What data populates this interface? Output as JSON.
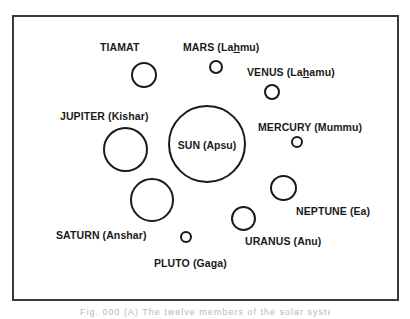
{
  "figure": {
    "stroke_color": "#1a1a1a",
    "frame_color": "#3a3a3a",
    "background": "#ffffff",
    "caption": "Fig. 000 (A) The twelve members of the solar system"
  },
  "bodies": [
    {
      "id": "sun",
      "label_main": "SUN",
      "label_alt": "(Apsu)",
      "cx": 207,
      "cy": 144,
      "r": 39,
      "label_x": 207,
      "label_y": 144,
      "label_inside": true
    },
    {
      "id": "tiamat",
      "label_main": "TIAMAT",
      "label_alt": "",
      "cx": 144,
      "cy": 75,
      "r": 13,
      "label_x": 100,
      "label_y": 43
    },
    {
      "id": "mars",
      "label_main": "MARS (La",
      "label_h": "h",
      "label_tail": "mu)",
      "cx": 216,
      "cy": 67,
      "r": 7,
      "label_x": 183,
      "label_y": 42
    },
    {
      "id": "venus",
      "label_main": "VENUS (La",
      "label_h": "h",
      "label_tail": "amu)",
      "cx": 272,
      "cy": 92,
      "r": 8,
      "label_x": 247,
      "label_y": 67
    },
    {
      "id": "jupiter",
      "label_main": "JUPITER",
      "label_alt": "(Kishar)",
      "cx": 125,
      "cy": 149,
      "r": 22,
      "label_x": 60,
      "label_y": 111
    },
    {
      "id": "mercury",
      "label_main": "MERCURY",
      "label_alt": "(Mummu)",
      "cx": 297,
      "cy": 142,
      "r": 6,
      "label_x": 258,
      "label_y": 121
    },
    {
      "id": "saturn",
      "label_main": "SATURN",
      "label_alt": "(Anshar)",
      "cx": 152,
      "cy": 200,
      "r": 22,
      "label_x": 56,
      "label_y": 229
    },
    {
      "id": "neptune",
      "label_main": "NEPTUNE",
      "label_alt": "(Ea)",
      "cx": 283,
      "cy": 188,
      "r": 13,
      "label_x": 296,
      "label_y": 205
    },
    {
      "id": "uranus",
      "label_main": "URANUS",
      "label_alt": "(Anu)",
      "cx": 243,
      "cy": 218,
      "r": 12,
      "label_x": 245,
      "label_y": 235
    },
    {
      "id": "pluto",
      "label_main": "PLUTO",
      "label_alt": "(Gaga)",
      "cx": 186,
      "cy": 237,
      "r": 6,
      "label_x": 154,
      "label_y": 257
    }
  ],
  "labels": {
    "sun": "SUN (Apsu)",
    "tiamat": "TIAMAT",
    "mars_pre": "MARS (La",
    "mars_h": "h",
    "mars_post": "mu)",
    "venus_pre": "VENUS (La",
    "venus_h": "h",
    "venus_post": "amu)",
    "jupiter": "JUPITER (Kishar)",
    "mercury": "MERCURY (Mummu)",
    "saturn": "SATURN (Anshar)",
    "neptune": "NEPTUNE (Ea)",
    "uranus": "URANUS (Anu)",
    "pluto": "PLUTO (Gaga)"
  }
}
